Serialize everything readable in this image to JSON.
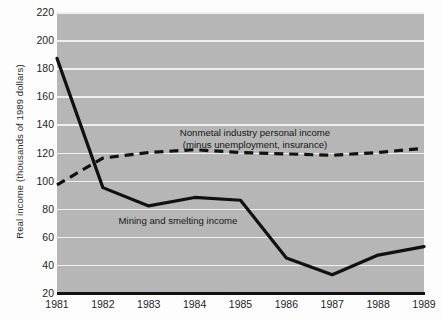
{
  "chart_data": {
    "type": "line",
    "title": "",
    "xlabel": "",
    "ylabel": "Real income (thousands of 1989 dollars)",
    "x": [
      1981,
      1982,
      1983,
      1984,
      1985,
      1986,
      1987,
      1988,
      1989
    ],
    "xtick_labels": [
      "1981",
      "1982",
      "1983",
      "1984",
      "1985",
      "1986",
      "1987",
      "1988",
      "1989"
    ],
    "ytick_labels": [
      "20",
      "40",
      "60",
      "80",
      "100",
      "120",
      "140",
      "160",
      "180",
      "200",
      "220"
    ],
    "ytick_values": [
      20,
      40,
      60,
      80,
      100,
      120,
      140,
      160,
      180,
      200,
      220
    ],
    "ylim": [
      20,
      220
    ],
    "xlim": [
      1981,
      1989
    ],
    "grid": "horizontal",
    "legend": "inline-annotations",
    "plot_background": "#b6b6b6",
    "gridline_color": "#efefef",
    "series": [
      {
        "name": "Mining and smelting income",
        "style": "solid",
        "color": "#111111",
        "values": [
          187,
          95,
          82,
          88,
          86,
          45,
          33,
          47,
          53
        ]
      },
      {
        "name": "Nonmetal industry personal income (minus unemployment, insurance)",
        "style": "dashed",
        "color": "#111111",
        "values": [
          97,
          116,
          120,
          122,
          120,
          119,
          118,
          120,
          123
        ]
      }
    ],
    "annotations": [
      {
        "id": "nonmetal",
        "line1": "Nonmetal industry personal income",
        "line2": "(minus unemployment, insurance)"
      },
      {
        "id": "mining",
        "line1": "Mining and smelting income",
        "line2": ""
      }
    ]
  }
}
